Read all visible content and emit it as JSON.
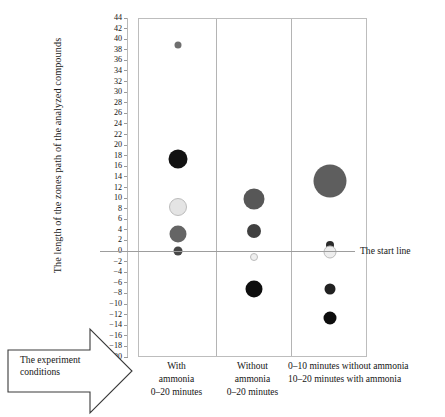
{
  "axes": {
    "ylabel": "The length of the zones path of the analyzed compounds",
    "yticks": [
      44,
      42,
      40,
      38,
      36,
      34,
      32,
      30,
      28,
      26,
      24,
      22,
      20,
      18,
      16,
      14,
      12,
      10,
      8,
      6,
      4,
      2,
      0,
      -2,
      -4,
      -6,
      -8,
      -10,
      -12,
      -14,
      -16,
      -18,
      -20
    ],
    "ymin": -20,
    "ymax": 44
  },
  "annotations": {
    "start_line": "The start line",
    "experiment_conditions": "The experiment conditions"
  },
  "categories": [
    {
      "lines": [
        "With",
        "ammonia",
        "0–20 minutes"
      ]
    },
    {
      "lines": [
        "Without",
        "ammonia",
        "0–20 minutes"
      ]
    },
    {
      "lines": [
        "0–10 minutes without ammonia",
        "10–20 minutes with ammonia"
      ]
    }
  ],
  "chart_data": {
    "type": "scatter",
    "title": "",
    "xlabel": "The experiment conditions",
    "ylabel": "The length of the zones path of the analyzed compounds",
    "ylim": [
      -20,
      44
    ],
    "ytick_step": 2,
    "grid": false,
    "legend": "none",
    "reference_line": {
      "value": 0,
      "label": "The start line"
    },
    "categories": [
      "With ammonia 0–20 minutes",
      "Without ammonia 0–20 minutes",
      "0–10 minutes without ammonia / 10–20 minutes with ammonia"
    ],
    "series": [
      {
        "name": "With ammonia 0–20 minutes",
        "points": [
          {
            "y": 39,
            "size": 7,
            "color": "#6f6f6f"
          },
          {
            "y": 17.5,
            "size": 19,
            "color": "#121212"
          },
          {
            "y": 8.5,
            "size": 18,
            "color": "#e4e4e4"
          },
          {
            "y": 3.5,
            "size": 17,
            "color": "#656565"
          },
          {
            "y": 0.2,
            "size": 9,
            "color": "#474747"
          }
        ]
      },
      {
        "name": "Without ammonia 0–20 minutes",
        "points": [
          {
            "y": 10,
            "size": 21,
            "color": "#575757"
          },
          {
            "y": 4,
            "size": 14,
            "color": "#404040"
          },
          {
            "y": -1,
            "size": 8,
            "color": "#efefef"
          },
          {
            "y": -7,
            "size": 17,
            "color": "#0e0e0e"
          }
        ]
      },
      {
        "name": "0–10 minutes without ammonia / 10–20 minutes with ammonia",
        "points": [
          {
            "y": 13.5,
            "size": 33,
            "color": "#5e5e5e"
          },
          {
            "y": 1.4,
            "size": 8,
            "color": "#2b2b2b"
          },
          {
            "y": 0,
            "size": 13,
            "color": "#eeeeee"
          },
          {
            "y": -7,
            "size": 11,
            "color": "#212121"
          },
          {
            "y": -12.5,
            "size": 13,
            "color": "#0d0d0d"
          }
        ]
      }
    ]
  }
}
